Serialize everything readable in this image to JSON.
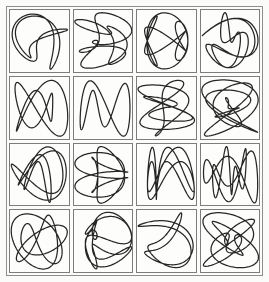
{
  "figure": {
    "rows": 4,
    "columns": 4,
    "cell_count": 16,
    "background_color": "#fbfbfa",
    "frame_color": "#8e8e8e",
    "cell_border_color": "#7d7d7d",
    "cell_background_color": "#fdfdfc",
    "stroke_color": "#262626",
    "stroke_width": "1.25"
  },
  "chart_data": {
    "type": "line",
    "subtitle": "",
    "xlabel": "",
    "ylabel": "",
    "grid": false,
    "legend": "none",
    "layout": {
      "rows": 4,
      "columns": 4,
      "panels": 16
    },
    "panel_domain": {
      "t_min": 0,
      "t_max": 6.2832,
      "samples": 400
    },
    "panel_xlim": [
      -1.15,
      1.15
    ],
    "panel_ylim": [
      -1.15,
      1.15
    ],
    "panels": [
      {
        "index": 0,
        "row": 0,
        "col": 0,
        "label": "cell-r1c1",
        "shape": "narrow vertical lens overlaid with a tilted diamond star",
        "params": {
          "a": 2,
          "b": 5,
          "c": 3,
          "d": 4,
          "phase_x": 0.35,
          "phase_y": 1.2,
          "w1": 0.78,
          "w2": 0.34
        },
        "bbox": [
          -0.55,
          -1.02,
          0.72,
          1.02
        ]
      },
      {
        "index": 1,
        "row": 0,
        "col": 1,
        "label": "cell-r1c2",
        "shape": "tall vertical spindle with left-side loops and horizontal spikes",
        "params": {
          "a": 3,
          "b": 7,
          "c": 2,
          "d": 5,
          "phase_x": 1.05,
          "phase_y": 0.2,
          "w1": 0.7,
          "w2": 0.42
        },
        "bbox": [
          -0.78,
          -1.05,
          0.86,
          1.05
        ]
      },
      {
        "index": 2,
        "row": 0,
        "col": 2,
        "label": "cell-r1c3",
        "shape": "vertical oval crossed by a four-armed star leaning right",
        "params": {
          "a": 2,
          "b": 6,
          "c": 5,
          "d": 3,
          "phase_x": 0.6,
          "phase_y": 1.55,
          "w1": 0.74,
          "w2": 0.38
        },
        "bbox": [
          -0.52,
          -0.98,
          0.95,
          0.98
        ]
      },
      {
        "index": 3,
        "row": 0,
        "col": 3,
        "label": "cell-r1c4",
        "shape": "vertical ellipse with long right-pointing rays and a small boxed centre",
        "params": {
          "a": 4,
          "b": 5,
          "c": 2,
          "d": 7,
          "phase_x": 0.15,
          "phase_y": 0.95,
          "w1": 0.66,
          "w2": 0.45
        },
        "bbox": [
          -0.6,
          -1.0,
          1.02,
          1.0
        ]
      },
      {
        "index": 4,
        "row": 1,
        "col": 0,
        "label": "cell-r2c1",
        "shape": "bowtie X on the left joined to a rounded lobed blob on the right",
        "params": {
          "a": 2,
          "b": 3,
          "c": 4,
          "d": 3,
          "phase_x": 0.9,
          "phase_y": 0.45,
          "w1": 0.82,
          "w2": 0.3
        },
        "bbox": [
          -1.0,
          -0.72,
          0.78,
          0.8
        ]
      },
      {
        "index": 5,
        "row": 1,
        "col": 1,
        "label": "cell-r2c2",
        "shape": "large near-circle with a small crescent wedge on its left",
        "params": {
          "a": 1,
          "b": 2,
          "c": 3,
          "d": 2,
          "phase_x": 1.4,
          "phase_y": 0.1,
          "w1": 0.9,
          "w2": 0.22
        },
        "bbox": [
          -0.92,
          -0.78,
          0.86,
          0.82
        ]
      },
      {
        "index": 6,
        "row": 1,
        "col": 2,
        "label": "cell-r2c3",
        "shape": "dense asterisk of rays with a triangular flag on the right",
        "params": {
          "a": 5,
          "b": 7,
          "c": 3,
          "d": 4,
          "phase_x": 0.25,
          "phase_y": 1.3,
          "w1": 0.62,
          "w2": 0.5
        },
        "bbox": [
          -1.0,
          -0.85,
          0.9,
          0.9
        ]
      },
      {
        "index": 7,
        "row": 1,
        "col": 3,
        "label": "cell-r2c4",
        "shape": "fan of long thin rays converging at a knot right of centre",
        "params": {
          "a": 6,
          "b": 7,
          "c": 4,
          "d": 5,
          "phase_x": 0.5,
          "phase_y": 0.75,
          "w1": 0.6,
          "w2": 0.52
        },
        "bbox": [
          -1.05,
          -0.8,
          0.78,
          0.86
        ]
      },
      {
        "index": 8,
        "row": 2,
        "col": 0,
        "label": "cell-r3c1",
        "shape": "tall slim leaf on the left with tangled overlapping loops at lower right",
        "params": {
          "a": 3,
          "b": 4,
          "c": 5,
          "d": 2,
          "phase_x": 1.15,
          "phase_y": 0.3,
          "w1": 0.75,
          "w2": 0.36
        },
        "bbox": [
          -0.68,
          -0.98,
          0.72,
          0.95
        ]
      },
      {
        "index": 9,
        "row": 2,
        "col": 1,
        "label": "cell-r3c2",
        "shape": "butterfly of paired side lobes with a starburst centre",
        "params": {
          "a": 4,
          "b": 6,
          "c": 3,
          "d": 5,
          "phase_x": 0.05,
          "phase_y": 1.1,
          "w1": 0.68,
          "w2": 0.44
        },
        "bbox": [
          -0.95,
          -0.9,
          0.92,
          0.9
        ]
      },
      {
        "index": 10,
        "row": 2,
        "col": 2,
        "label": "cell-r3c3",
        "shape": "rounded shell outline enclosing a small crossed star",
        "params": {
          "a": 2,
          "b": 4,
          "c": 6,
          "d": 3,
          "phase_x": 0.8,
          "phase_y": 0.6,
          "w1": 0.8,
          "w2": 0.32
        },
        "bbox": [
          -1.0,
          -0.75,
          0.85,
          0.82
        ]
      },
      {
        "index": 11,
        "row": 2,
        "col": 3,
        "label": "cell-r3c4",
        "shape": "broad symmetric wing shape with a horizontal spike through the middle",
        "params": {
          "a": 2,
          "b": 3,
          "c": 7,
          "d": 4,
          "phase_x": 1.55,
          "phase_y": 0.85,
          "w1": 0.72,
          "w2": 0.4
        },
        "bbox": [
          -1.05,
          -0.85,
          0.95,
          0.85
        ]
      },
      {
        "index": 12,
        "row": 3,
        "col": 0,
        "label": "cell-r4c1",
        "shape": "cluster of round interlocking loops beside a narrow vertical lens",
        "params": {
          "a": 3,
          "b": 5,
          "c": 4,
          "d": 3,
          "phase_x": 0.45,
          "phase_y": 1.45,
          "w1": 0.83,
          "w2": 0.28
        },
        "bbox": [
          -0.88,
          -0.82,
          0.8,
          0.82
        ]
      },
      {
        "index": 13,
        "row": 3,
        "col": 1,
        "label": "cell-r4c2",
        "shape": "upright spindle with swept arrow arms and a looped tail",
        "params": {
          "a": 3,
          "b": 6,
          "c": 2,
          "d": 7,
          "phase_x": 1.25,
          "phase_y": 0.5,
          "w1": 0.7,
          "w2": 0.43
        },
        "bbox": [
          -0.85,
          -1.02,
          0.9,
          1.0
        ]
      },
      {
        "index": 14,
        "row": 3,
        "col": 2,
        "label": "cell-r4c3",
        "shape": "three-bladed propeller radiating from a tight central knot",
        "params": {
          "a": 3,
          "b": 4,
          "c": 2,
          "d": 5,
          "phase_x": 0.7,
          "phase_y": 1.7,
          "w1": 0.85,
          "w2": 0.26
        },
        "bbox": [
          -0.82,
          -1.0,
          0.9,
          0.95
        ]
      },
      {
        "index": 15,
        "row": 3,
        "col": 3,
        "label": "cell-r4c4",
        "shape": "oval body with a sheaf of straight rays fanning to the upper right",
        "params": {
          "a": 4,
          "b": 7,
          "c": 5,
          "d": 2,
          "phase_x": 0.3,
          "phase_y": 1.0,
          "w1": 0.64,
          "w2": 0.47
        },
        "bbox": [
          -0.7,
          -0.95,
          1.05,
          0.9
        ]
      }
    ]
  }
}
